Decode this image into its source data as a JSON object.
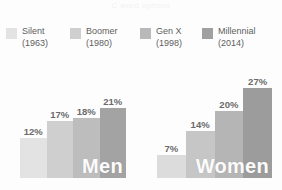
{
  "watermark": "C word options",
  "legend": {
    "items": [
      {
        "generation": "Silent",
        "year": "(1963)",
        "color": "#e3e3e3"
      },
      {
        "generation": "Boomer",
        "year": "(1980)",
        "color": "#cfcfcf"
      },
      {
        "generation": "Gen X",
        "year": "(1998)",
        "color": "#b9b9b9"
      },
      {
        "generation": "Millennial",
        "year": "(2014)",
        "color": "#a0a0a0"
      }
    ]
  },
  "chart_data": {
    "type": "bar",
    "title": "",
    "xlabel": "",
    "ylabel": "",
    "ylim": [
      0,
      30
    ],
    "grid": false,
    "legend_position": "top",
    "categories": [
      "Silent (1963)",
      "Boomer (1980)",
      "Gen X (1998)",
      "Millennial (2014)"
    ],
    "panels": [
      {
        "name": "Men",
        "label": "Men",
        "bars": [
          {
            "category": "Silent (1963)",
            "value": 12,
            "label": "12%",
            "color": "#e3e3e3"
          },
          {
            "category": "Boomer (1980)",
            "value": 17,
            "label": "17%",
            "color": "#cfcfcf"
          },
          {
            "category": "Gen X (1998)",
            "value": 18,
            "label": "18%",
            "color": "#bdbdbd"
          },
          {
            "category": "Millennial (2014)",
            "value": 21,
            "label": "21%",
            "color": "#a3a3a3"
          }
        ]
      },
      {
        "name": "Women",
        "label": "Women",
        "bars": [
          {
            "category": "Silent (1963)",
            "value": 7,
            "label": "7%",
            "color": "#dcdcdc"
          },
          {
            "category": "Boomer (1980)",
            "value": 14,
            "label": "14%",
            "color": "#c6c6c6"
          },
          {
            "category": "Gen X (1998)",
            "value": 20,
            "label": "20%",
            "color": "#b5b5b5"
          },
          {
            "category": "Millennial (2014)",
            "value": 27,
            "label": "27%",
            "color": "#9c9c9c"
          }
        ]
      }
    ]
  }
}
